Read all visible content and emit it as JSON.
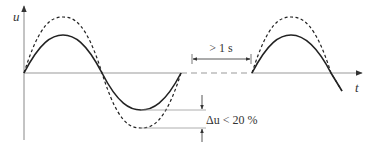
{
  "diagram": {
    "y_axis_label": "u",
    "x_axis_label": "t",
    "interruption_label": "> 1 s",
    "dip_label": "Δu < 20 %",
    "series": [
      {
        "name": "nominal voltage",
        "style": "dashed",
        "peak_y": 17
      },
      {
        "name": "reduced voltage",
        "style": "solid",
        "peak_y": 35
      }
    ],
    "colors": {
      "curve": "#222222",
      "axis": "#888888",
      "text": "#333333"
    }
  }
}
